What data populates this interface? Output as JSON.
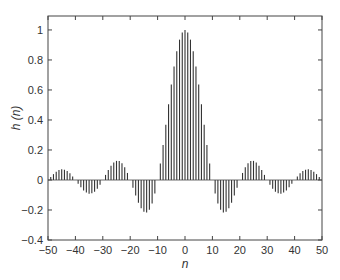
{
  "chart_data": {
    "type": "stem",
    "title": "",
    "xlabel": "n",
    "ylabel": "h (n)",
    "xlim": [
      -50,
      50
    ],
    "ylim": [
      -0.4,
      1.093
    ],
    "xticks": [
      -50,
      -40,
      -30,
      -20,
      -10,
      0,
      10,
      20,
      30,
      40,
      50
    ],
    "xtick_labels": [
      "−50",
      "−40",
      "−30",
      "−20",
      "−10",
      "0",
      "10",
      "20",
      "30",
      "40",
      "50"
    ],
    "yticks": [
      -0.4,
      -0.2,
      0,
      0.2,
      0.4,
      0.6,
      0.8,
      1
    ],
    "ytick_labels": [
      "−0.4",
      "−0.2",
      "0",
      "0.2",
      "0.4",
      "0.6",
      "0.8",
      "1"
    ],
    "grid": false,
    "legend": null,
    "series": [
      {
        "name": "h(n)",
        "formula": "sin(pi*n/10)/(pi*n/10)",
        "x_start": -50,
        "x_end": 50,
        "values": [
          0,
          0.0126,
          0.0256,
          0.0382,
          0.0497,
          0.0594,
          0.0665,
          0.0706,
          0.0713,
          0.0682,
          0,
          -0.0764,
          -0.0909,
          -0.0926,
          -0.0867,
          -0.0707,
          -0.0545,
          -0.0339,
          -0.0173,
          -0.0052,
          0,
          0.0071,
          0.0229,
          0.0421,
          0.0613,
          0.1273,
          0.1038,
          0.121,
          0.1287,
          0.1303,
          0,
          -0.0786,
          -0.1051,
          -0.156,
          -0.1891,
          -0.2122,
          -0.2162,
          -0.2021,
          -0.1683,
          -0.1093,
          0,
          0.1093,
          0.2339,
          0.3679,
          0.5046,
          0.6366,
          0.7568,
          0.8584,
          0.9355,
          0.9836,
          1,
          0.9836,
          0.9355,
          0.8584,
          0.7568,
          0.6366,
          0.5046,
          0.3679,
          0.2339,
          0.1093,
          0,
          -0.1093,
          -0.1683,
          -0.2021,
          -0.2162,
          -0.2122,
          -0.1891,
          -0.156,
          -0.1051,
          -0.0786,
          0,
          0.1303,
          0.1287,
          0.121,
          0.1038,
          0.1273,
          0.0613,
          0.0421,
          0.0229,
          0.0071,
          0,
          -0.0052,
          -0.0173,
          -0.0339,
          -0.0545,
          -0.0707,
          -0.0867,
          -0.0926,
          -0.0909,
          -0.0764,
          0,
          0.0682,
          0.0713,
          0.0706,
          0.0665,
          0.0594,
          0.0497,
          0.0382,
          0.0256,
          0.0126,
          0
        ]
      }
    ]
  },
  "colors": {
    "stem": "#333333",
    "axis": "#444444",
    "background": "#ffffff"
  }
}
